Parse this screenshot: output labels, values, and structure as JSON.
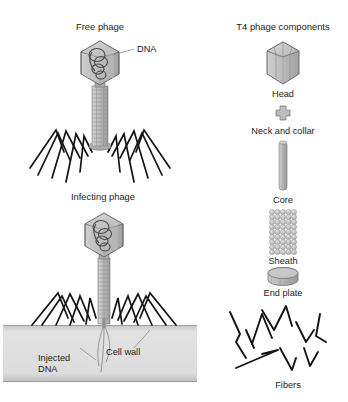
{
  "figure": {
    "background_color": "#ffffff",
    "ink_color": "#1c1c1c"
  },
  "panels": {
    "free_phage": {
      "title": "Free phage",
      "labels": {
        "dna": "DNA"
      }
    },
    "infecting_phage": {
      "title": "Infecting phage",
      "labels": {
        "injected_dna_line1": "Injected",
        "injected_dna_line2": "DNA",
        "cell_wall": "Cell wall"
      }
    },
    "components": {
      "title": "T4 phage components",
      "items": [
        {
          "label": "Head",
          "icon": "hexagonal-prism-icon"
        },
        {
          "label": "Neck and collar",
          "icon": "cross-collar-icon"
        },
        {
          "label": "Core",
          "icon": "thin-cylinder-icon"
        },
        {
          "label": "Sheath",
          "icon": "beaded-cylinder-icon"
        },
        {
          "label": "End plate",
          "icon": "disc-icon"
        },
        {
          "label": "Fibers",
          "icon": "zigzag-fibers-icon"
        }
      ]
    }
  },
  "colors": {
    "head_fill": "#b9b9b9",
    "head_light": "#d2d2d2",
    "head_dark": "#9a9a9a",
    "tail_fill": "#bdbdbd",
    "cell_wall_fill": "#dcdcdc",
    "cell_wall_edge": "#b0b0b0",
    "fiber_stroke": "#141414",
    "outline": "#555555"
  }
}
